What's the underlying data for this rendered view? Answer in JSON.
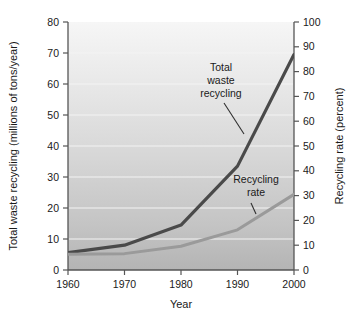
{
  "chart_data": {
    "type": "line",
    "title": "",
    "xlabel": "Year",
    "ylabel": "Total waste recycling (millions of tons/year)",
    "y2label": "Recycling rate (percent)",
    "x": [
      1960,
      1970,
      1980,
      1990,
      2000
    ],
    "xlim": [
      1960,
      2000
    ],
    "xticks": [
      1960,
      1970,
      1980,
      1990,
      2000
    ],
    "xtick_labels": [
      "1960",
      "1970",
      "1980",
      "1990",
      "2000"
    ],
    "ylim": [
      0,
      80
    ],
    "yticks": [
      0,
      10,
      20,
      30,
      40,
      50,
      60,
      70,
      80
    ],
    "ytick_labels": [
      "0",
      "10",
      "20",
      "30",
      "40",
      "50",
      "60",
      "70",
      "80"
    ],
    "y2lim": [
      0,
      100
    ],
    "y2ticks": [
      0,
      10,
      20,
      30,
      40,
      50,
      60,
      70,
      80,
      90,
      100
    ],
    "y2tick_labels": [
      "0",
      "10",
      "20",
      "30",
      "40",
      "50",
      "60",
      "70",
      "80",
      "90",
      "100"
    ],
    "grid": true,
    "legend_position": "inline-annotations",
    "series": [
      {
        "name": "Total waste recycling",
        "axis": "left",
        "units": "millions of tons/year",
        "color": "#4a4a4a",
        "values": [
          5.6,
          8.0,
          14.5,
          33.5,
          69.5
        ]
      },
      {
        "name": "Recycling rate",
        "axis": "right",
        "units": "percent",
        "color": "#9a9a9a",
        "values": [
          6.4,
          6.6,
          9.6,
          16.2,
          30.5
        ]
      }
    ],
    "annotations": [
      {
        "id": "total-waste-recycling",
        "text": "Total waste recycling",
        "lines": [
          "Total",
          "waste",
          "recycling"
        ]
      },
      {
        "id": "recycling-rate",
        "text": "Recycling rate",
        "lines": [
          "Recycling",
          "rate"
        ]
      }
    ],
    "colors": {
      "plot_background_top": "#f2f2f2",
      "plot_background_bottom": "#b8b8b8",
      "gridline": "#f4f4f4",
      "axis": "#555555",
      "series_total_waste": "#4a4a4a",
      "series_recycling_rate": "#9a9a9a"
    }
  }
}
